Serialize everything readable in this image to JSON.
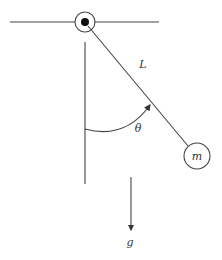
{
  "labels": {
    "length": "L",
    "angle": "θ",
    "mass": "m",
    "gravity": "g"
  },
  "colors": {
    "line": "#444444",
    "text": "#333333",
    "background": "#ffffff"
  }
}
